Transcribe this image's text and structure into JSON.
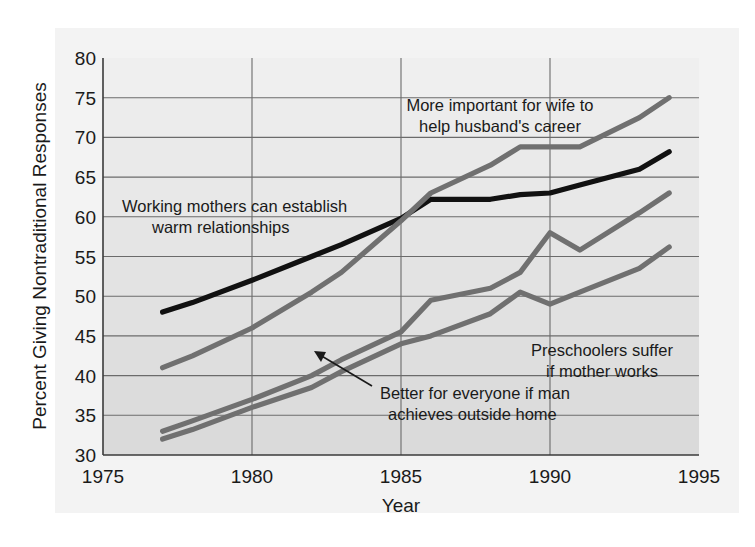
{
  "figure": {
    "background_color": "#ffffff",
    "panel_color": "#f2f2f2",
    "plot_color": "#e8e8e8",
    "band_color": "#dedede",
    "grid_color": "#6e6e6e",
    "axis_color": "#3a3a3a"
  },
  "chart_data": {
    "type": "line",
    "title": "",
    "xlabel": "Year",
    "ylabel": "Percent Giving Nontraditional Responses",
    "xlim": [
      1975,
      1995
    ],
    "ylim": [
      30,
      80
    ],
    "xticks": [
      1975,
      1980,
      1985,
      1990,
      1995
    ],
    "yticks": [
      30,
      35,
      40,
      45,
      50,
      55,
      60,
      65,
      70,
      75,
      80
    ],
    "grid": true,
    "legend": "inline-annotations",
    "x": [
      1977,
      1978,
      1980,
      1982,
      1983,
      1985,
      1986,
      1988,
      1989,
      1990,
      1991,
      1993,
      1994
    ],
    "series": [
      {
        "name": "Working mothers can establish warm relationships",
        "color": "#111111",
        "values": [
          48.0,
          49.2,
          52.0,
          55.0,
          56.5,
          59.8,
          62.2,
          62.2,
          62.8,
          63.0,
          64.0,
          66.0,
          68.2
        ]
      },
      {
        "name": "More important for wife to help husband's career",
        "color": "#707070",
        "values": [
          41.0,
          42.5,
          46.0,
          50.5,
          53.0,
          59.5,
          63.0,
          66.5,
          68.8,
          68.8,
          68.8,
          72.5,
          75.0
        ]
      },
      {
        "name": "Preschoolers suffer if mother works",
        "color": "#707070",
        "values": [
          33.0,
          34.3,
          37.0,
          40.0,
          42.0,
          45.5,
          49.5,
          51.0,
          53.0,
          58.0,
          55.8,
          60.5,
          63.0
        ]
      },
      {
        "name": "Better for everyone if man achieves outside home",
        "color": "#707070",
        "values": [
          32.0,
          33.2,
          36.0,
          38.5,
          40.5,
          44.0,
          45.0,
          47.8,
          50.5,
          49.0,
          50.5,
          53.5,
          56.2
        ]
      }
    ],
    "annotations": [
      {
        "name": "working-mothers",
        "lines": [
          "Working mothers can establish",
          "warm relationships"
        ],
        "x": 122,
        "y": 207
      },
      {
        "name": "wife-career",
        "lines": [
          "More important for wife to",
          "help husband's career"
        ],
        "x": 380,
        "y": 107
      },
      {
        "name": "preschoolers",
        "lines": [
          "Preschoolers suffer",
          "if mother works"
        ],
        "x": 506,
        "y": 350
      },
      {
        "name": "man-achieves",
        "lines": [
          "Better for everyone if man",
          "achieves outside home"
        ],
        "x": 348,
        "y": 393
      }
    ],
    "arrow": {
      "from_x": 372,
      "from_y": 386,
      "to_x": 316,
      "to_y": 352
    }
  }
}
